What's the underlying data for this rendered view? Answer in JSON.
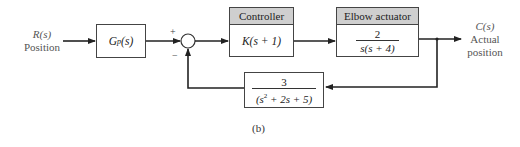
{
  "input": {
    "signal": "R(s)",
    "name": "Position"
  },
  "output": {
    "signal": "C(s)",
    "name_line1": "Actual",
    "name_line2": "position"
  },
  "blocks": {
    "plant_prefilter": {
      "tf": "Gp(s)",
      "tf_main": "G",
      "tf_sub": "p",
      "tf_arg": "(s)"
    },
    "controller": {
      "header": "Controller",
      "tf": "K(s + 1)"
    },
    "actuator": {
      "header": "Elbow actuator",
      "numerator": "2",
      "denominator": "s(s + 4)"
    },
    "feedback": {
      "numerator": "3",
      "denominator_pre": "(s",
      "denominator_exp": "2",
      "denominator_post": " + 2s + 5)"
    }
  },
  "summing_junction": {
    "plus": "+",
    "minus": "−"
  },
  "caption": "(b)",
  "colors": {
    "line": "#222222",
    "header_fill": "#cfcfcf",
    "label_text": "#555555"
  }
}
